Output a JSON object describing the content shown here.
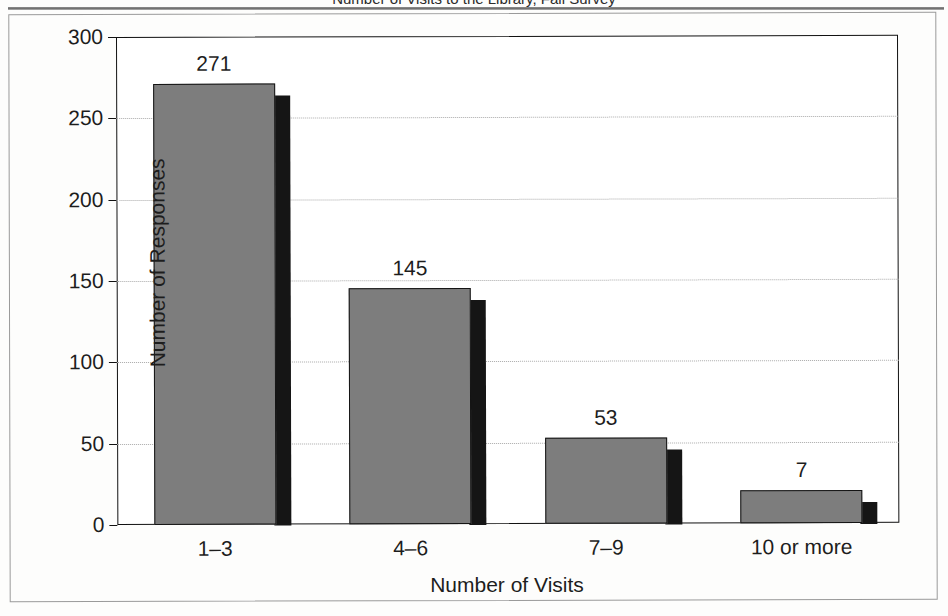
{
  "figure": {
    "caption_partial": "Number of Visits to the Library, Fall Survey",
    "page_background": "#fdfdfc",
    "frame_color": "#9a9a9a"
  },
  "chart_data": {
    "type": "bar",
    "title": "",
    "xlabel": "Number of Visits",
    "ylabel": "Number of Responses",
    "categories": [
      "1–3",
      "4–6",
      "7–9",
      "10 or more"
    ],
    "values": [
      271,
      145,
      53,
      7
    ],
    "bar_draw_heights": [
      271,
      145,
      53,
      20
    ],
    "value_labels": [
      "271",
      "145",
      "53",
      "7"
    ],
    "ylim": [
      0,
      300
    ],
    "yticks": [
      0,
      50,
      100,
      150,
      200,
      250,
      300
    ],
    "ytick_labels": [
      "0",
      "50",
      "100",
      "150",
      "200",
      "250",
      "300"
    ],
    "grid": true,
    "legend": "none",
    "colors": {
      "bar_fill": "#7d7d7d",
      "bar_edge": "#141414",
      "bar_shadow": "#151515",
      "gridline": "#a9a9a9",
      "axis": "#111111",
      "text": "#1d1d1d",
      "plot_background": "#ffffff"
    }
  }
}
